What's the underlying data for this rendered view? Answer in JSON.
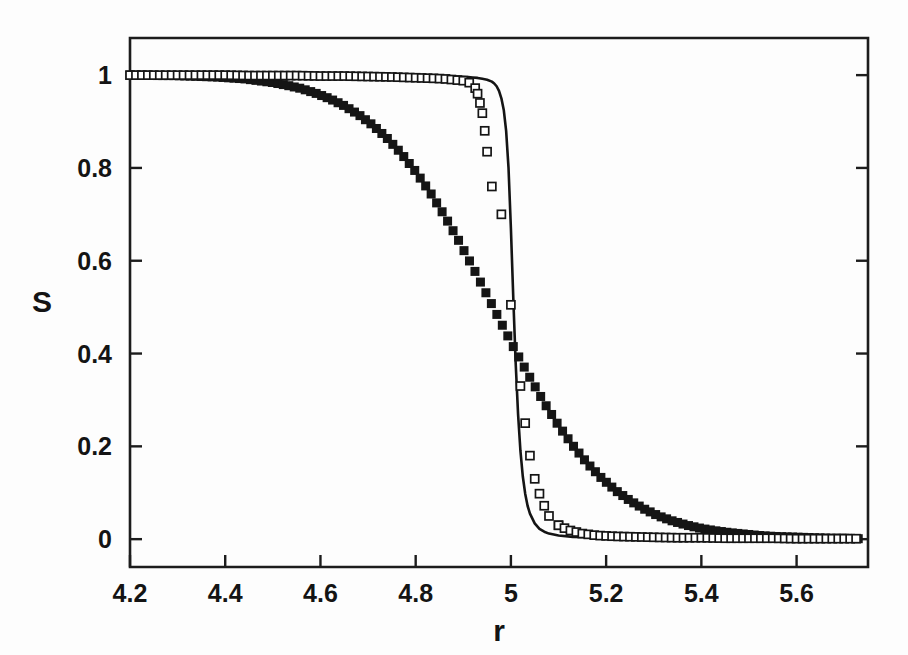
{
  "figure": {
    "background_color": "#fdfdfd",
    "ink_color": "#151515"
  },
  "axes": {
    "x_title": "r",
    "y_title": "S",
    "x_ticks": [
      "4.2",
      "4.4",
      "4.6",
      "4.8",
      "5",
      "5.2",
      "5.4",
      "5.6"
    ],
    "y_ticks": [
      "0",
      "0.2",
      "0.4",
      "0.6",
      "0.8",
      "1"
    ]
  },
  "chart_data": {
    "type": "scatter",
    "title": "",
    "subtitle": "",
    "xlabel": "r",
    "ylabel": "S",
    "xlim": [
      4.2,
      5.75
    ],
    "ylim": [
      -0.06,
      1.08
    ],
    "x_ticks": [
      4.2,
      4.4,
      4.6,
      4.8,
      5.0,
      5.2,
      5.4,
      5.6
    ],
    "y_ticks": [
      0,
      0.2,
      0.4,
      0.6,
      0.8,
      1.0
    ],
    "grid": false,
    "legend": "none",
    "legend_position": "none",
    "annotations": [],
    "series": [
      {
        "name": "broad transition (filled squares)",
        "marker": "filled-square",
        "marker_size": 9,
        "color": "#151515",
        "x": [
          4.2,
          4.23,
          4.26,
          4.29,
          4.32,
          4.35,
          4.38,
          4.41,
          4.44,
          4.47,
          4.5,
          4.53,
          4.56,
          4.59,
          4.62,
          4.65,
          4.68,
          4.71,
          4.74,
          4.77,
          4.8,
          4.83,
          4.86,
          4.89,
          4.92,
          4.95,
          4.98,
          5.01,
          5.04,
          5.07,
          5.1,
          5.13,
          5.16,
          5.19,
          5.22,
          5.25,
          5.28,
          5.31,
          5.34,
          5.37,
          5.4,
          5.43,
          5.46,
          5.49,
          5.52,
          5.55,
          5.58,
          5.61,
          5.64,
          5.67,
          5.7,
          5.73
        ],
        "y": [
          1.0,
          1.0,
          0.999,
          0.999,
          0.998,
          0.997,
          0.996,
          0.994,
          0.992,
          0.988,
          0.984,
          0.978,
          0.971,
          0.961,
          0.949,
          0.934,
          0.915,
          0.892,
          0.864,
          0.831,
          0.792,
          0.748,
          0.698,
          0.644,
          0.586,
          0.526,
          0.465,
          0.405,
          0.348,
          0.294,
          0.245,
          0.202,
          0.164,
          0.132,
          0.105,
          0.083,
          0.065,
          0.05,
          0.039,
          0.03,
          0.023,
          0.018,
          0.014,
          0.011,
          0.008,
          0.006,
          0.005,
          0.004,
          0.003,
          0.002,
          0.002,
          0.001
        ]
      },
      {
        "name": "sharp transition (open squares)",
        "marker": "open-square",
        "marker_size": 8,
        "color": "#151515",
        "x": [
          4.2,
          4.25,
          4.3,
          4.35,
          4.4,
          4.45,
          4.5,
          4.55,
          4.6,
          4.65,
          4.7,
          4.75,
          4.78,
          4.81,
          4.84,
          4.86,
          4.88,
          4.9,
          4.91,
          4.92,
          4.925,
          4.93,
          4.935,
          4.94,
          4.945,
          4.95,
          4.96,
          4.98,
          5.0,
          5.02,
          5.03,
          5.04,
          5.05,
          5.06,
          5.07,
          5.08,
          5.1,
          5.12,
          5.15,
          5.18,
          5.22,
          5.26,
          5.3,
          5.35,
          5.4,
          5.45,
          5.5,
          5.55,
          5.6,
          5.65,
          5.7,
          5.73
        ],
        "y": [
          1.0,
          1.0,
          1.0,
          1.0,
          1.0,
          0.999,
          0.999,
          0.999,
          0.998,
          0.998,
          0.997,
          0.996,
          0.995,
          0.994,
          0.993,
          0.992,
          0.99,
          0.988,
          0.985,
          0.98,
          0.972,
          0.96,
          0.94,
          0.918,
          0.88,
          0.835,
          0.76,
          0.7,
          0.505,
          0.33,
          0.25,
          0.18,
          0.13,
          0.098,
          0.072,
          0.05,
          0.03,
          0.02,
          0.012,
          0.008,
          0.006,
          0.005,
          0.004,
          0.003,
          0.003,
          0.002,
          0.002,
          0.002,
          0.001,
          0.001,
          0.001,
          0.001
        ]
      },
      {
        "name": "theory curve (solid line)",
        "marker": "none",
        "line": "solid",
        "color": "#141414",
        "x": [
          4.2,
          4.3,
          4.4,
          4.5,
          4.6,
          4.7,
          4.75,
          4.8,
          4.84,
          4.87,
          4.89,
          4.91,
          4.92,
          4.93,
          4.94,
          4.95,
          4.96,
          4.965,
          4.97,
          4.975,
          4.98,
          4.985,
          4.99,
          4.995,
          5.0,
          5.005,
          5.01,
          5.015,
          5.02,
          5.025,
          5.03,
          5.035,
          5.04,
          5.05,
          5.06,
          5.07,
          5.08,
          5.1,
          5.13,
          5.17,
          5.22,
          5.3,
          5.4,
          5.5,
          5.6,
          5.7,
          5.73
        ],
        "y": [
          1.0,
          1.0,
          1.0,
          1.0,
          1.0,
          0.999,
          0.999,
          0.999,
          0.998,
          0.998,
          0.997,
          0.996,
          0.995,
          0.994,
          0.992,
          0.99,
          0.986,
          0.982,
          0.976,
          0.966,
          0.95,
          0.925,
          0.88,
          0.8,
          0.67,
          0.52,
          0.38,
          0.27,
          0.19,
          0.135,
          0.098,
          0.072,
          0.055,
          0.034,
          0.022,
          0.016,
          0.012,
          0.008,
          0.005,
          0.004,
          0.003,
          0.002,
          0.002,
          0.001,
          0.001,
          0.001,
          0.001
        ]
      }
    ]
  }
}
